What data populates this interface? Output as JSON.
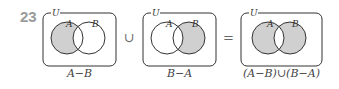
{
  "problem_number": "23",
  "universal_label": "U",
  "set_a_label": "A",
  "set_b_label": "B",
  "shade_color": "#d0d0d0",
  "line_color": "#333333",
  "diagrams": [
    {
      "caption": "A−B",
      "shaded": "A only"
    },
    {
      "caption": "B−A",
      "shaded": "B only"
    },
    {
      "caption": "(A−B)∪(B−A)",
      "shaded": "A and B except intersection"
    }
  ],
  "operators": [
    "∪",
    "="
  ]
}
